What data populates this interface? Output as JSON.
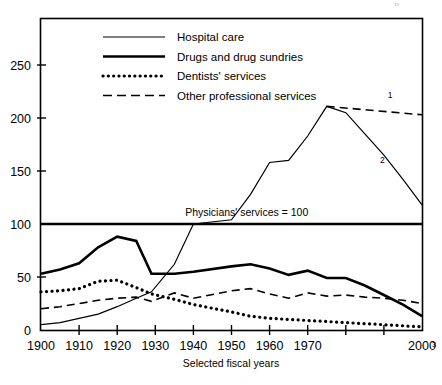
{
  "header": {
    "clipped_text": "p.............."
  },
  "chart_data": {
    "type": "line",
    "title": "",
    "xlabel": "Selected fiscal years",
    "ylabel": "",
    "xlim": [
      1900,
      2000
    ],
    "ylim": [
      0,
      275
    ],
    "grid": false,
    "legend_position": "top-left-inside",
    "reference_line": {
      "value": 100,
      "label": "Physicians' services = 100"
    },
    "x_ticks": [
      1900,
      1910,
      1920,
      1930,
      1940,
      1950,
      1960,
      1970,
      1980,
      1990,
      2000
    ],
    "x_tick_labels": [
      "1900",
      "1910",
      "1920",
      "1930",
      "1940",
      "1950",
      "1960",
      "1970",
      "",
      "",
      "2000"
    ],
    "x_axis_footnote": "3",
    "y_ticks": [
      0,
      50,
      100,
      150,
      200,
      250
    ],
    "y_tick_labels": [
      "0",
      "50",
      "100",
      "150",
      "200",
      "250"
    ],
    "x": [
      1900,
      1905,
      1910,
      1915,
      1920,
      1925,
      1929,
      1935,
      1940,
      1950,
      1955,
      1960,
      1965,
      1970,
      1975,
      1980,
      1985,
      1990,
      1995,
      2000
    ],
    "series": [
      {
        "name": "Hospital care",
        "style": "thin-solid",
        "values": [
          5,
          7,
          11,
          15,
          22,
          30,
          36,
          62,
          100,
          104,
          128,
          158,
          160,
          183,
          211,
          205,
          185,
          165,
          142,
          118
        ],
        "end_footnote": "2"
      },
      {
        "name": "Drugs and drug sundries",
        "style": "thick-solid",
        "values": [
          53,
          57,
          63,
          78,
          88,
          84,
          53,
          53,
          55,
          60,
          62,
          58,
          52,
          56,
          49,
          49,
          42,
          33,
          24,
          13
        ]
      },
      {
        "name": "Dentists' services",
        "style": "dotted",
        "values": [
          36,
          37,
          39,
          46,
          47,
          40,
          34,
          29,
          24,
          17,
          13,
          11,
          10,
          9,
          8,
          7,
          6,
          5,
          4,
          3
        ]
      },
      {
        "name": "Other professional services",
        "style": "dashed",
        "values": [
          20,
          22,
          25,
          28,
          30,
          31,
          27,
          35,
          30,
          37,
          39,
          34,
          30,
          35,
          32,
          33,
          31,
          30,
          28,
          25
        ]
      }
    ],
    "projection": {
      "name": "Hospital care projection",
      "style": "dashed",
      "from": {
        "x": 1975,
        "y": 211
      },
      "to": {
        "x": 2000,
        "y": 203
      },
      "footnote": "1"
    },
    "annotations": [
      {
        "text": "Physicians' services = 100",
        "x": 1954,
        "y": 108
      },
      {
        "text": "1",
        "x": 1991,
        "y": 219
      },
      {
        "text": "2",
        "x": 1989,
        "y": 158
      }
    ]
  },
  "legend": {
    "items": [
      {
        "label": "Hospital care",
        "style": "thin-solid"
      },
      {
        "label": "Drugs and drug sundries",
        "style": "thick-solid"
      },
      {
        "label": "Dentists' services",
        "style": "dotted"
      },
      {
        "label": "Other professional services",
        "style": "dashed"
      }
    ]
  }
}
